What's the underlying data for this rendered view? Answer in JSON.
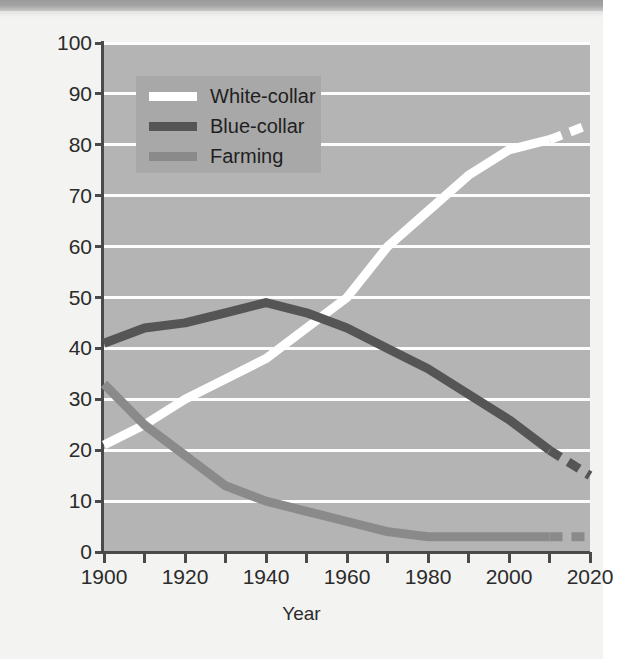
{
  "figure": {
    "axis_title_x": "Year",
    "axis_title_y": "Percentage"
  },
  "legend": {
    "position": "top-left-inside",
    "background_color": "#a8a8a8",
    "items": [
      {
        "label": "White-collar",
        "color": "#ffffff"
      },
      {
        "label": "Blue-collar",
        "color": "#555555"
      },
      {
        "label": "Farming",
        "color": "#8a8a8a"
      }
    ]
  },
  "axes": {
    "y_ticks": [
      "0",
      "10",
      "20",
      "30",
      "40",
      "50",
      "60",
      "70",
      "80",
      "90",
      "100"
    ],
    "x_ticks_major": [
      "1900",
      "1920",
      "1940",
      "1960",
      "1980",
      "2000",
      "2020"
    ],
    "x_ticks_minor": [
      "1910",
      "1930",
      "1950",
      "1970",
      "1990",
      "2010"
    ],
    "plot_background": "#b4b4b4",
    "gridline_color": "#fdfdfd"
  },
  "chart_data": {
    "type": "line",
    "title": "",
    "xlabel": "Year",
    "ylabel": "Percentage",
    "xlim": [
      1900,
      2020
    ],
    "ylim": [
      0,
      100
    ],
    "grid": true,
    "legend_position": "upper left",
    "x": [
      1900,
      1910,
      1920,
      1930,
      1940,
      1950,
      1960,
      1970,
      1980,
      1990,
      2000,
      2010,
      2020
    ],
    "series": [
      {
        "name": "White-collar",
        "color": "#ffffff",
        "values": [
          21,
          25,
          30,
          34,
          38,
          44,
          50,
          60,
          67,
          74,
          79,
          81,
          84
        ],
        "projected_from": 2010,
        "projected_style": "dashed"
      },
      {
        "name": "Blue-collar",
        "color": "#555555",
        "values": [
          41,
          44,
          45,
          47,
          49,
          47,
          44,
          40,
          36,
          31,
          26,
          20,
          15
        ],
        "projected_from": 2010,
        "projected_style": "dashed"
      },
      {
        "name": "Farming",
        "color": "#8a8a8a",
        "values": [
          33,
          25,
          19,
          13,
          10,
          8,
          6,
          4,
          3,
          3,
          3,
          3,
          3
        ],
        "projected_from": 2010,
        "projected_style": "dashed"
      }
    ]
  }
}
